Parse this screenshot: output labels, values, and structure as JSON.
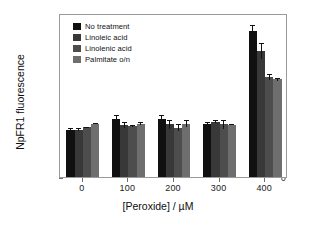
{
  "chart_data": {
    "type": "bar",
    "title": "",
    "xlabel": "[Peroxide] / µM",
    "ylabel": "NpFR1 fluorescence",
    "categories": [
      "0",
      "100",
      "200",
      "300",
      "400"
    ],
    "xlim": [
      -60,
      460
    ],
    "ylim": [
      0,
      2150
    ],
    "ytick_labels": [
      "0",
      "500",
      "1000",
      "1500",
      "2000"
    ],
    "ytick_values": [
      0,
      500,
      1000,
      1500,
      2000
    ],
    "xtick_labels": [
      "0",
      "100",
      "200",
      "300",
      "400"
    ],
    "grid": false,
    "legend_position": "top-left",
    "series": [
      {
        "name": "No treatment",
        "color": "#101010",
        "values": [
          620,
          760,
          760,
          695,
          1915
        ],
        "errors": [
          28,
          58,
          55,
          22,
          75
        ]
      },
      {
        "name": "Linoleic acid",
        "color": "#383838",
        "values": [
          620,
          680,
          690,
          725,
          1655
        ],
        "errors": [
          20,
          42,
          58,
          18,
          105
        ]
      },
      {
        "name": "Linolenic acid",
        "color": "#4d4d4d",
        "values": [
          650,
          665,
          645,
          690,
          1310
        ],
        "errors": [
          12,
          12,
          45,
          60,
          35
        ]
      },
      {
        "name": "Palmitate o/n",
        "color": "#6e6e6e",
        "values": [
          700,
          700,
          700,
          688,
          1280
        ],
        "errors": [
          8,
          15,
          50,
          12,
          22
        ]
      }
    ]
  },
  "legend": {
    "items": [
      {
        "label": "No treatment",
        "color": "#101010"
      },
      {
        "label": "Linoleic acid",
        "color": "#383838"
      },
      {
        "label": "Linolenic acid",
        "color": "#4d4d4d"
      },
      {
        "label": "Palmitate o/n",
        "color": "#6e6e6e"
      }
    ]
  }
}
